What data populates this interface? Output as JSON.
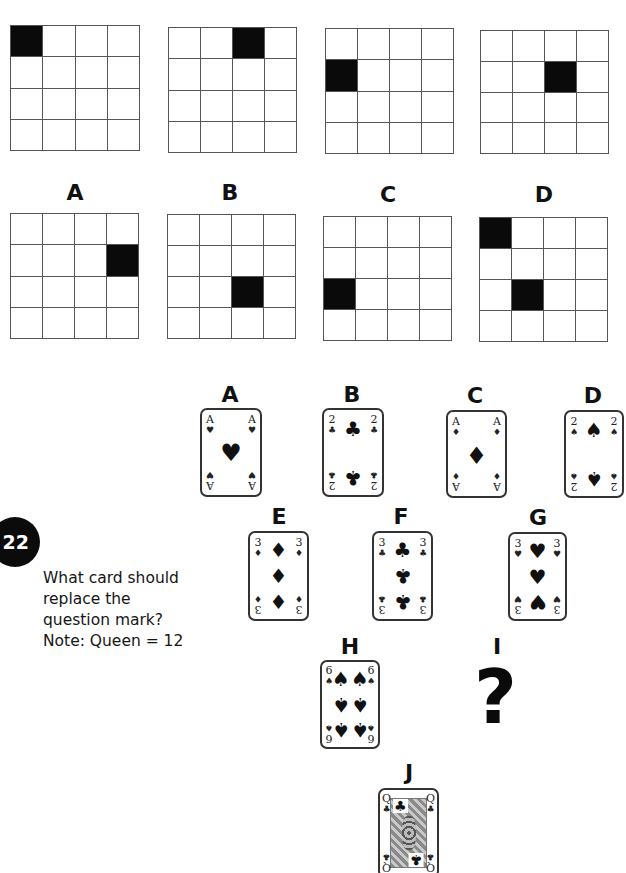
{
  "grid_puzzle": {
    "sequence": [
      {
        "filled": [
          [
            0,
            0
          ]
        ]
      },
      {
        "filled": [
          [
            0,
            2
          ]
        ]
      },
      {
        "filled": [
          [
            1,
            0
          ]
        ]
      },
      {
        "filled": [
          [
            1,
            2
          ]
        ]
      }
    ],
    "options": [
      {
        "label": "A",
        "filled": [
          [
            1,
            3
          ]
        ]
      },
      {
        "label": "B",
        "filled": [
          [
            2,
            2
          ]
        ]
      },
      {
        "label": "C",
        "filled": [
          [
            2,
            0
          ]
        ]
      },
      {
        "label": "D",
        "filled": [
          [
            0,
            0
          ],
          [
            2,
            1
          ]
        ]
      }
    ]
  },
  "question": {
    "number": "22",
    "lines": [
      "What card should",
      "replace the",
      "question mark?",
      "Note: Queen = 12"
    ]
  },
  "cards": [
    {
      "label": "A",
      "rank": "A",
      "suit": "heart",
      "glyph": "♥"
    },
    {
      "label": "B",
      "rank": "2",
      "suit": "club",
      "glyph": "♣"
    },
    {
      "label": "C",
      "rank": "A",
      "suit": "diamond",
      "glyph": "♦"
    },
    {
      "label": "D",
      "rank": "2",
      "suit": "spade",
      "glyph": "♠"
    },
    {
      "label": "E",
      "rank": "3",
      "suit": "diamond",
      "glyph": "♦"
    },
    {
      "label": "F",
      "rank": "3",
      "suit": "club",
      "glyph": "♣"
    },
    {
      "label": "G",
      "rank": "3",
      "suit": "heart",
      "glyph": "♥"
    },
    {
      "label": "H",
      "rank": "6",
      "suit": "spade",
      "glyph": "♠"
    },
    {
      "label": "I",
      "rank": "?",
      "suit": "unknown",
      "glyph": "?"
    },
    {
      "label": "J",
      "rank": "Q",
      "suit": "club",
      "glyph": "♣"
    }
  ]
}
